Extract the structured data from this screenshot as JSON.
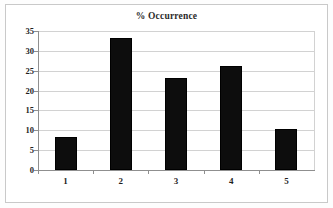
{
  "chart_data": {
    "type": "bar",
    "title": "% Occurrence",
    "xlabel": "",
    "ylabel": "",
    "categories": [
      "1",
      "2",
      "3",
      "4",
      "5"
    ],
    "values": [
      8.2,
      33.2,
      23.2,
      26.2,
      10.3
    ],
    "ylim": [
      0,
      35
    ],
    "ytick_labels": [
      "0",
      "5",
      "10",
      "15",
      "20",
      "25",
      "30",
      "35"
    ],
    "ytick_values": [
      0,
      5,
      10,
      15,
      20,
      25,
      30,
      35
    ],
    "grid": true,
    "legend": false,
    "bar_color": "#0d0d0d",
    "grid_color": "#d2d2d2",
    "axis_color": "#8f8f8f",
    "background_color": "#ffffff",
    "frame_color": "#c9c9c9"
  }
}
